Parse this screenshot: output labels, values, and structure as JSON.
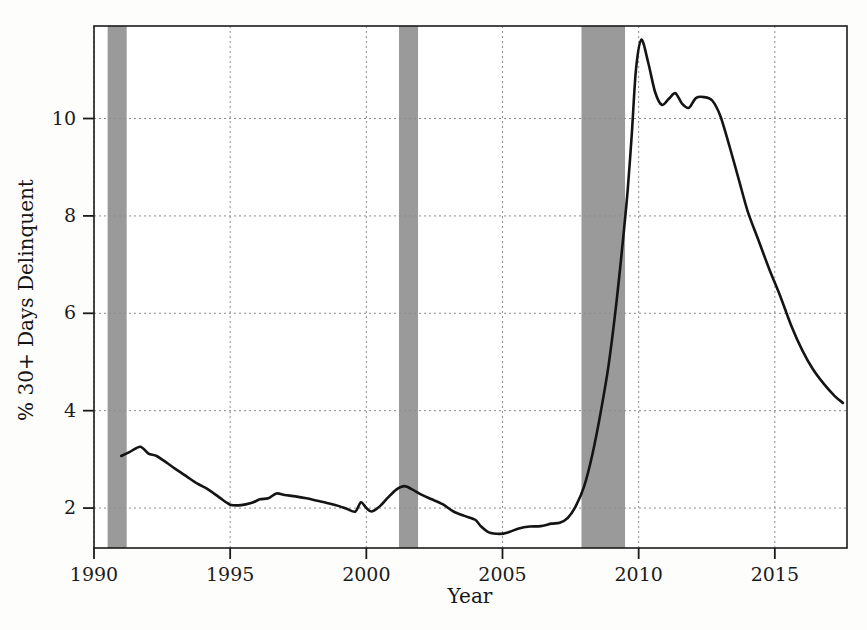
{
  "chart_data": {
    "type": "line",
    "title": "",
    "xlabel": "Year",
    "ylabel": "% 30+ Days Delinquent",
    "xlim": [
      1990,
      1991.5
    ],
    "ylim": [
      1.18,
      11.9
    ],
    "xticks": [
      1990,
      1995,
      2000,
      2005,
      2010,
      2015
    ],
    "xtick_labels": [
      "1990",
      "1995",
      "2000",
      "2005",
      "2010",
      "2015"
    ],
    "yticks": [
      2,
      4,
      6,
      8,
      10
    ],
    "ytick_labels": [
      "2",
      "4",
      "6",
      "8",
      "10"
    ],
    "grid": "dotted-both-axes",
    "legend": "none",
    "line_color": "#141414",
    "line_width": 2.6,
    "band_color": "#9a9a9a",
    "axis_color": "#1b1b1b",
    "grid_color": "#8c8c8c",
    "x_axis_range": [
      1990,
      1991.5
    ],
    "recession_bands": [
      {
        "name": "1990-91 recession",
        "start": 1990.5,
        "end": 1991.2
      },
      {
        "name": "2001 recession",
        "start": 2001.2,
        "end": 2001.9
      },
      {
        "name": "2008-09 Great Recession",
        "start": 2007.9,
        "end": 2009.5
      }
    ],
    "series": [
      {
        "name": "% 30+ Days Delinquent",
        "x": [
          1991.0,
          1991.3,
          1991.7,
          1992.0,
          1992.3,
          1992.7,
          1993.0,
          1993.4,
          1993.8,
          1994.2,
          1994.6,
          1995.0,
          1995.4,
          1995.8,
          1996.1,
          1996.4,
          1996.7,
          1997.0,
          1997.4,
          1997.8,
          1998.2,
          1998.6,
          1999.0,
          1999.3,
          1999.6,
          1999.8,
          2000.0,
          2000.2,
          2000.5,
          2000.8,
          2001.1,
          2001.4,
          2001.7,
          2002.0,
          2002.4,
          2002.8,
          2003.2,
          2003.6,
          2004.0,
          2004.2,
          2004.5,
          2004.9,
          2005.2,
          2005.6,
          2006.0,
          2006.4,
          2006.8,
          2007.1,
          2007.4,
          2007.7,
          2008.0,
          2008.3,
          2008.6,
          2008.9,
          2009.2,
          2009.45,
          2009.6,
          2009.75,
          2009.9,
          2010.1,
          2010.35,
          2010.6,
          2010.85,
          2011.1,
          2011.35,
          2011.6,
          2011.85,
          2012.1,
          2012.4,
          2012.7,
          2013.0,
          2013.35,
          2013.7,
          2014.0,
          2014.4,
          2014.8,
          2015.2,
          2015.6,
          2016.0,
          2016.4,
          2016.8,
          2017.2,
          2017.5
        ],
        "y": [
          3.07,
          3.15,
          3.26,
          3.12,
          3.07,
          2.92,
          2.8,
          2.65,
          2.5,
          2.38,
          2.22,
          2.07,
          2.06,
          2.11,
          2.18,
          2.2,
          2.3,
          2.27,
          2.24,
          2.2,
          2.15,
          2.1,
          2.04,
          1.98,
          1.93,
          2.12,
          2.0,
          1.93,
          2.04,
          2.22,
          2.38,
          2.45,
          2.38,
          2.28,
          2.18,
          2.08,
          1.93,
          1.84,
          1.76,
          1.63,
          1.5,
          1.47,
          1.5,
          1.58,
          1.62,
          1.63,
          1.68,
          1.7,
          1.8,
          2.05,
          2.45,
          3.1,
          3.95,
          4.95,
          6.3,
          7.65,
          8.55,
          9.7,
          11.0,
          11.62,
          11.15,
          10.55,
          10.28,
          10.4,
          10.52,
          10.3,
          10.22,
          10.42,
          10.44,
          10.37,
          10.05,
          9.4,
          8.7,
          8.1,
          7.5,
          6.9,
          6.35,
          5.75,
          5.25,
          4.85,
          4.55,
          4.3,
          4.16
        ]
      }
    ]
  },
  "axes": {
    "x_title": "Year",
    "y_title": "% 30+ Days Delinquent"
  }
}
